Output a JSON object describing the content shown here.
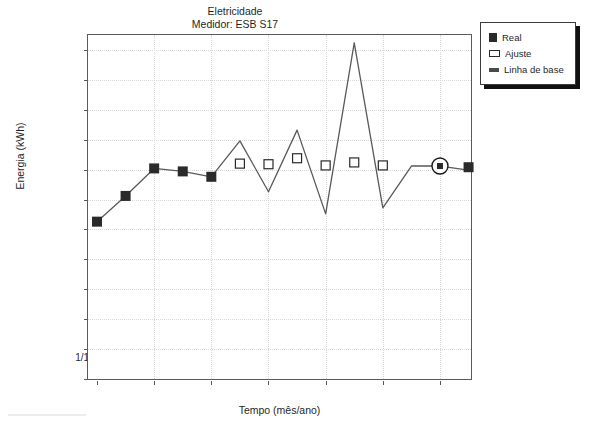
{
  "title": {
    "line1": "Eletricidade",
    "line2": "Medidor: ESB S17"
  },
  "axes": {
    "ylabel": "Energia (kWh)",
    "xlabel": "Tempo (mês/ano)",
    "yticks": [
      "0",
      "500.000",
      "1.000.000",
      "1.500.000",
      "2.000.000",
      "2.500.000",
      "3.000.000",
      "3.500.000",
      "4.000.000",
      "4.500.000",
      "5.000.000",
      "5.500.000"
    ],
    "xticks": [
      "1/11/2006",
      "1/1/2007",
      "1/3/2007",
      "1/5/2007",
      "1/7/2007",
      "1/9/2007",
      "1/11/2007"
    ]
  },
  "legend": {
    "items": [
      {
        "label": "Real",
        "marker": "filled-square-icon",
        "color": "#2a2a2a"
      },
      {
        "label": "Ajuste",
        "marker": "open-square-icon",
        "color": "#2a2a2a"
      },
      {
        "label": "Linha de base",
        "marker": "line-icon",
        "color": "#4a4a4a"
      }
    ]
  },
  "chart_data": {
    "type": "line",
    "xlabel": "Tempo (mês/ano)",
    "ylabel": "Energia (kWh)",
    "ylim": [
      0,
      5750000
    ],
    "yticks": [
      0,
      500000,
      1000000,
      1500000,
      2000000,
      2500000,
      3000000,
      3500000,
      4000000,
      4500000,
      5000000,
      5500000
    ],
    "grid": true,
    "legend_position": "outside-top-right",
    "x": [
      "1/11/2006",
      "1/12/2006",
      "1/1/2007",
      "1/2/2007",
      "1/3/2007",
      "1/4/2007",
      "1/5/2007",
      "1/6/2007",
      "1/7/2007",
      "1/8/2007",
      "1/9/2007",
      "1/10/2007",
      "1/11/2007",
      "1/12/2007"
    ],
    "series": [
      {
        "name": "Linha de base",
        "type": "line",
        "color": "#595959",
        "values": [
          2630000,
          3060000,
          3520000,
          3470000,
          3380000,
          3980000,
          3130000,
          4160000,
          2760000,
          5620000,
          2860000,
          3560000,
          3560000,
          3490000
        ]
      },
      {
        "name": "Real",
        "type": "scatter-filled-square",
        "color": "#2a2a2a",
        "points": [
          {
            "x": "1/11/2006",
            "y": 2630000
          },
          {
            "x": "1/12/2006",
            "y": 3060000
          },
          {
            "x": "1/1/2007",
            "y": 3520000
          },
          {
            "x": "1/2/2007",
            "y": 3470000
          },
          {
            "x": "1/3/2007",
            "y": 3380000
          },
          {
            "x": "1/11/2007",
            "y": 3560000,
            "highlighted": true
          },
          {
            "x": "1/12/2007",
            "y": 3540000
          }
        ]
      },
      {
        "name": "Ajuste",
        "type": "scatter-open-square",
        "color": "#2a2a2a",
        "points": [
          {
            "x": "1/4/2007",
            "y": 3600000
          },
          {
            "x": "1/5/2007",
            "y": 3590000
          },
          {
            "x": "1/6/2007",
            "y": 3690000
          },
          {
            "x": "1/7/2007",
            "y": 3570000
          },
          {
            "x": "1/8/2007",
            "y": 3620000
          },
          {
            "x": "1/9/2007",
            "y": 3570000
          }
        ]
      }
    ],
    "annotations": [
      {
        "type": "circle-highlight",
        "x": "1/11/2007",
        "y": 3560000,
        "note": "marcador destacado"
      }
    ]
  }
}
